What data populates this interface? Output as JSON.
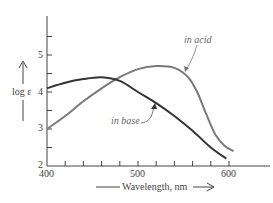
{
  "chart_data": {
    "type": "line",
    "title": "",
    "xlabel": "Wavelength, nm",
    "ylabel": "log ε",
    "xlim": [
      400,
      640
    ],
    "ylim": [
      2,
      5.9
    ],
    "x_ticks_labeled": [
      400,
      500,
      600
    ],
    "x_ticks_minor_step": 20,
    "y_ticks_labeled": [
      2,
      3,
      4,
      5
    ],
    "y_ticks_minor_step": 0.5,
    "grid": false,
    "legend": "inline annotations",
    "series": [
      {
        "name": "in acid",
        "color": "#7a7a7a",
        "x": [
          400,
          420,
          440,
          460,
          480,
          500,
          520,
          540,
          555,
          565,
          575,
          585,
          595,
          605
        ],
        "y": [
          3.0,
          3.35,
          3.75,
          4.1,
          4.4,
          4.62,
          4.7,
          4.65,
          4.4,
          4.0,
          3.4,
          2.85,
          2.55,
          2.4
        ]
      },
      {
        "name": "in base",
        "color": "#333333",
        "x": [
          400,
          420,
          440,
          460,
          480,
          500,
          520,
          540,
          560,
          580,
          597
        ],
        "y": [
          4.1,
          4.25,
          4.35,
          4.4,
          4.3,
          4.0,
          3.7,
          3.35,
          2.95,
          2.5,
          2.2
        ]
      }
    ],
    "annotations": [
      {
        "text": "in acid",
        "points_to_series": "in acid"
      },
      {
        "text": "in base",
        "points_to_series": "in base"
      }
    ]
  },
  "labels": {
    "y_axis": "log ε",
    "x_axis": "Wavelength, nm",
    "acid": "in acid",
    "base": "in base",
    "x400": "400",
    "x500": "500",
    "x600": "600",
    "y2": "2",
    "y3": "3",
    "y4": "4",
    "y5": "5"
  }
}
